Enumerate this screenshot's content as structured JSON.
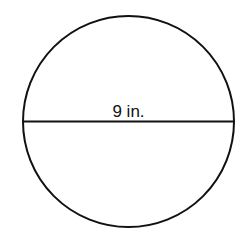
{
  "diagram": {
    "shape": "circle",
    "diameter_label": "9 in.",
    "stroke_color": "#111111",
    "background_color": "#ffffff"
  }
}
